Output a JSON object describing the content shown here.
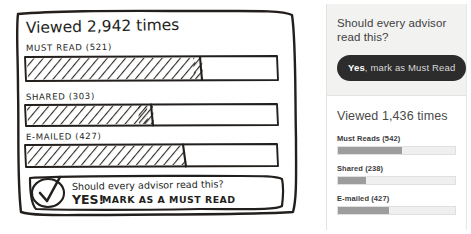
{
  "sketch": {
    "title": "Viewed 2,942 times",
    "bars": [
      {
        "label": "MUST READ (521)",
        "value": 521,
        "fill_pct": 70
      },
      {
        "label": "SHARED (303)",
        "value": 303,
        "fill_pct": 51
      },
      {
        "label": "E-MAILED (427)",
        "value": 427,
        "fill_pct": 66
      }
    ],
    "callout": {
      "check_icon": "checkmark-circle-icon",
      "question": "Should every advisor read this?",
      "answer_emphasis": "YES!",
      "answer_rest": "MARK AS A MUST READ"
    }
  },
  "ui": {
    "ask": {
      "question": "Should every advisor read this?",
      "button_strong": "Yes",
      "button_rest": ", mark as Must Read"
    },
    "stats": {
      "title": "Viewed 1,436 times",
      "rows": [
        {
          "label": "Must Reads (542)",
          "value": 542,
          "fill_pct": 55
        },
        {
          "label": "Shared (238)",
          "value": 238,
          "fill_pct": 24
        },
        {
          "label": "E-mailed (427)",
          "value": 427,
          "fill_pct": 44
        }
      ]
    }
  },
  "colors": {
    "ink": "#231f1d",
    "button_bg": "#2c2c2c",
    "bar_fill": "#9d9d9d",
    "bar_track": "#efefef",
    "panel_header_bg": "#f2f2f1"
  }
}
